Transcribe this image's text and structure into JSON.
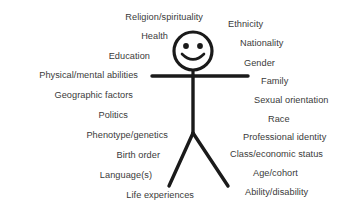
{
  "diagram": {
    "background_color": "#ffffff",
    "text_color": "#3a3a3a",
    "stroke_color": "#1a1a1a",
    "figure": {
      "name": "stick-figure",
      "description": "Smiling stick figure with round head, horizontal arms, vertical torso and two splayed legs",
      "head": {
        "cx": 193,
        "cy": 51,
        "r": 19,
        "stroke_width": 3.2
      },
      "eyes": [
        {
          "cx": 186,
          "cy": 46,
          "r": 2.9
        },
        {
          "cx": 200,
          "cy": 46,
          "r": 2.9
        }
      ],
      "smile": {
        "path": "M 182 54 Q 193 65 204 54",
        "stroke_width": 2.6
      },
      "neck": {
        "x1": 193,
        "y1": 70,
        "x2": 193,
        "y2": 76,
        "stroke_width": 3.2
      },
      "arms": {
        "x1": 152,
        "y1": 76,
        "x2": 248,
        "y2": 76,
        "stroke_width": 3.4
      },
      "torso": {
        "x1": 193,
        "y1": 76,
        "x2": 193,
        "y2": 133,
        "stroke_width": 3.4
      },
      "leg_left": {
        "x1": 193,
        "y1": 133,
        "x2": 169,
        "y2": 186,
        "stroke_width": 3.4
      },
      "leg_right": {
        "x1": 193,
        "y1": 133,
        "x2": 228,
        "y2": 186,
        "stroke_width": 3.4
      }
    },
    "left_labels": [
      {
        "text": "Religion/spirituality",
        "right": 203,
        "top": 12
      },
      {
        "text": "Health",
        "right": 168,
        "top": 31
      },
      {
        "text": "Education",
        "right": 150,
        "top": 51
      },
      {
        "text": "Physical/mental abilities",
        "right": 138,
        "top": 70
      },
      {
        "text": "Geographic factors",
        "right": 133,
        "top": 90
      },
      {
        "text": "Politics",
        "right": 128,
        "top": 110
      },
      {
        "text": "Phenotype/genetics",
        "right": 168,
        "top": 130
      },
      {
        "text": "Birth order",
        "right": 160,
        "top": 150
      },
      {
        "text": "Language(s)",
        "right": 152,
        "top": 170
      },
      {
        "text": "Life experiences",
        "right": 194,
        "top": 190
      }
    ],
    "right_labels": [
      {
        "text": "Ethnicity",
        "left": 228,
        "top": 19
      },
      {
        "text": "Nationality",
        "left": 240,
        "top": 38
      },
      {
        "text": "Gender",
        "left": 244,
        "top": 58
      },
      {
        "text": "Family",
        "left": 261,
        "top": 76
      },
      {
        "text": "Sexual orientation",
        "left": 254,
        "top": 95
      },
      {
        "text": "Race",
        "left": 268,
        "top": 114
      },
      {
        "text": "Professional identity",
        "left": 243,
        "top": 132
      },
      {
        "text": "Class/economic status",
        "left": 230,
        "top": 149
      },
      {
        "text": "Age/cohort",
        "left": 253,
        "top": 168
      },
      {
        "text": "Ability/disability",
        "left": 245,
        "top": 187
      }
    ]
  }
}
